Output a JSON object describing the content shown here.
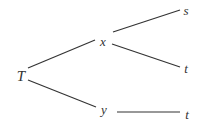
{
  "diagram": {
    "type": "tree",
    "line_color": "#333333",
    "nodes": [
      {
        "id": "T",
        "label": "T"
      },
      {
        "id": "x",
        "label": "x"
      },
      {
        "id": "y",
        "label": "y"
      },
      {
        "id": "s",
        "label": "s"
      },
      {
        "id": "t1",
        "label": "t"
      },
      {
        "id": "t2",
        "label": "t"
      }
    ],
    "edges": [
      {
        "from": "T",
        "to": "x"
      },
      {
        "from": "T",
        "to": "y"
      },
      {
        "from": "x",
        "to": "s"
      },
      {
        "from": "x",
        "to": "t1"
      },
      {
        "from": "y",
        "to": "t2"
      }
    ]
  }
}
